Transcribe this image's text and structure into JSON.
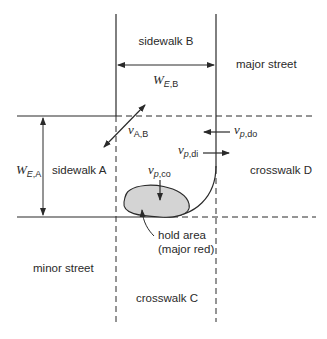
{
  "diagram": {
    "colors": {
      "line": "#2a2a2a",
      "hold_area_fill": "#d4d4d4",
      "background": "#ffffff"
    },
    "labels": {
      "sidewalk_b": "sidewalk B",
      "major_street": "major street",
      "sidewalk_a": "sidewalk A",
      "crosswalk_d": "crosswalk D",
      "minor_street": "minor street",
      "crosswalk_c": "crosswalk C",
      "hold_area_line1": "hold area",
      "hold_area_line2": "(major red)"
    },
    "symbols": {
      "w_eb": {
        "main": "W",
        "sub_italic": "E",
        "sub": ",B"
      },
      "w_ea": {
        "main": "W",
        "sub_italic": "E",
        "sub": ",A"
      },
      "v_ab": {
        "main": "v",
        "sub": "A,B"
      },
      "v_pdo": {
        "main": "v",
        "sub_italic": "p",
        "sub": ",do"
      },
      "v_pdi": {
        "main": "v",
        "sub_italic": "p",
        "sub": ",di"
      },
      "v_pco": {
        "main": "v",
        "sub_italic": "p",
        "sub": ",co"
      }
    }
  }
}
